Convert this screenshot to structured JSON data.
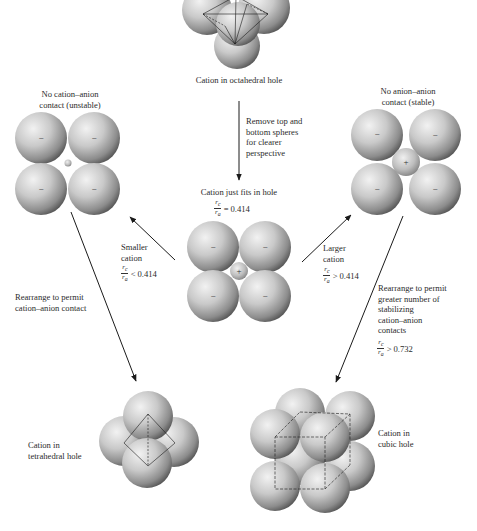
{
  "figure": {
    "top": {
      "caption": "Cation in octahedral hole"
    },
    "step_down": {
      "lines": [
        "Remove top and",
        "bottom spheres",
        "for clearer",
        "perspective"
      ]
    },
    "center": {
      "caption": "Cation just fits in hole",
      "ratio": {
        "numerator": "r",
        "numerator_sub": "c",
        "denominator": "r",
        "denominator_sub": "a",
        "relation": "=",
        "value": "0.414"
      },
      "anion_sign": "−",
      "cation_sign": "+"
    },
    "left": {
      "caption_lines": [
        "No cation–anion",
        "contact (unstable)"
      ],
      "anion_sign": "−"
    },
    "right": {
      "caption_lines": [
        "No anion–anion",
        "contact (stable)"
      ],
      "anion_sign": "−",
      "cation_sign": "+"
    },
    "smaller": {
      "lines": [
        "Smaller",
        "cation"
      ],
      "ratio": {
        "numerator": "r",
        "numerator_sub": "c",
        "denominator": "r",
        "denominator_sub": "a",
        "relation": "<",
        "value": "0.414"
      }
    },
    "larger": {
      "lines": [
        "Larger",
        "cation"
      ],
      "ratio": {
        "numerator": "r",
        "numerator_sub": "c",
        "denominator": "r",
        "denominator_sub": "a",
        "relation": ">",
        "value": "0.414"
      }
    },
    "rearrange_left": {
      "lines": [
        "Rearrange to permit",
        "cation–anion contact"
      ]
    },
    "rearrange_right": {
      "lines": [
        "Rearrange to permit",
        "greater number of",
        "stabilizing",
        "cation–anion",
        "contacts"
      ],
      "ratio": {
        "numerator": "r",
        "numerator_sub": "c",
        "denominator": "r",
        "denominator_sub": "a",
        "relation": ">",
        "value": "0.732"
      }
    },
    "tetrahedral": {
      "caption_lines": [
        "Cation in",
        "tetrahedral hole"
      ]
    },
    "cubic": {
      "caption_lines": [
        "Cation in",
        "cubic hole"
      ]
    },
    "colors": {
      "sphere_light": "#e6e6e6",
      "sphere_mid": "#a9a9a9",
      "sphere_dark": "#4a4a4a",
      "line": "#1a1a1a",
      "text": "#2b2b2b"
    }
  }
}
